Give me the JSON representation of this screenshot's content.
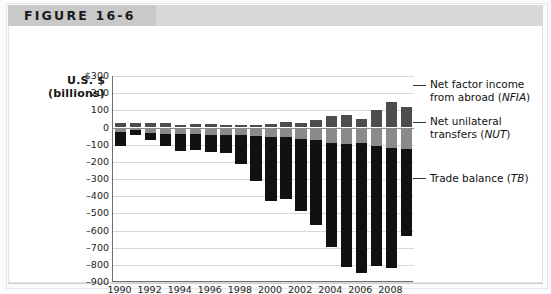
{
  "figure": {
    "label": "FIGURE 16-6"
  },
  "axis": {
    "title_line1": "U.S. $",
    "title_line2": "(billions)",
    "y_ticks": [
      "$300",
      "200",
      "100",
      "0",
      "–100",
      "–200",
      "–300",
      "–400",
      "–500",
      "–600",
      "–700",
      "–800",
      "–900"
    ],
    "x_ticks": [
      "1990",
      "1992",
      "1994",
      "1996",
      "1998",
      "2000",
      "2002",
      "2004",
      "2006",
      "2008"
    ]
  },
  "legend": [
    {
      "key": "nfia",
      "line1": "Net factor income",
      "line2": "from abroad (",
      "abbr": "NFIA",
      "close": ")",
      "color": "#4d4d4d"
    },
    {
      "key": "nut",
      "line1": "Net unilateral",
      "line2": "transfers (",
      "abbr": "NUT",
      "close": ")",
      "color": "#8a8a8a"
    },
    {
      "key": "tb",
      "line1": "Trade balance (",
      "line2": "",
      "abbr": "TB",
      "close": ")",
      "color": "#111111"
    }
  ],
  "chart_data": {
    "type": "bar",
    "subtype": "stacked-diverging",
    "title": "",
    "xlabel": "",
    "ylabel": "U.S. $ (billions)",
    "ylim": [
      -900,
      300
    ],
    "ytick_step": 100,
    "grid": true,
    "legend_position": "right",
    "categories": [
      1990,
      1991,
      1992,
      1993,
      1994,
      1995,
      1996,
      1997,
      1998,
      1999,
      2000,
      2001,
      2002,
      2003,
      2004,
      2005,
      2006,
      2007,
      2008,
      2009
    ],
    "series": [
      {
        "name": "Net factor income from abroad (NFIA)",
        "color": "#4d4d4d",
        "values": [
          29,
          25,
          24,
          24,
          17,
          21,
          22,
          16,
          12,
          14,
          21,
          32,
          27,
          46,
          67,
          72,
          48,
          101,
          146,
          121
        ]
      },
      {
        "name": "Net unilateral transfers (NUT)",
        "color": "#8a8a8a",
        "values": [
          -27,
          -12,
          -33,
          -38,
          -39,
          -37,
          -41,
          -41,
          -45,
          -49,
          -54,
          -55,
          -65,
          -72,
          -88,
          -98,
          -92,
          -105,
          -122,
          -125
        ]
      },
      {
        "name": "Trade balance (TB)",
        "color": "#111111",
        "values": [
          -80,
          -31,
          -39,
          -70,
          -98,
          -96,
          -104,
          -108,
          -166,
          -263,
          -377,
          -362,
          -421,
          -495,
          -610,
          -714,
          -753,
          -700,
          -696,
          -505
        ]
      }
    ]
  }
}
